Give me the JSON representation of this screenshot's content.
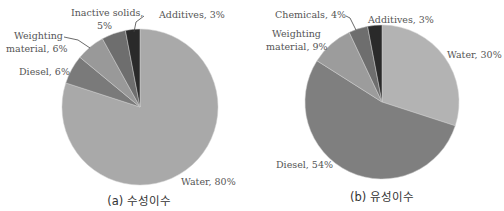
{
  "chart_data": [
    {
      "type": "pie",
      "title": "(a) 수성이수",
      "categories": [
        "Water",
        "Diesel",
        "Weighting material",
        "Inactive solids",
        "Additives"
      ],
      "values": [
        80,
        6,
        6,
        5,
        3
      ],
      "unit": "%",
      "colors": [
        "#a9a9a9",
        "#7a7a7a",
        "#999999",
        "#6e6e6e",
        "#2a2a2a"
      ],
      "labels": [
        "Water, 80%",
        "Diesel, 6%",
        "Weighting material, 6%",
        "Inactive solids, 5%",
        "Additives, 3%"
      ]
    },
    {
      "type": "pie",
      "title": "(b) 유성이수",
      "categories": [
        "Water",
        "Diesel",
        "Weighting material",
        "Chemicals",
        "Additives"
      ],
      "values": [
        30,
        54,
        9,
        4,
        3
      ],
      "unit": "%",
      "colors": [
        "#b3b3b3",
        "#7f7f7f",
        "#9c9c9c",
        "#6e6e6e",
        "#2a2a2a"
      ],
      "labels": [
        "Water, 30%",
        "Diesel, 54%",
        "Weighting material, 9%",
        "Chemicals, 4%",
        "Additives, 3%"
      ]
    }
  ],
  "captions": {
    "left": "(a) 수성이수",
    "right": "(b) 유성이수"
  },
  "left_labels": {
    "inactive_1": "Inactive solids,",
    "inactive_2": "5%",
    "additives": "Additives, 3%",
    "weighting_1": "Weighting",
    "weighting_2": "material, 6%",
    "diesel": "Diesel, 6%",
    "water": "Water, 80%"
  },
  "right_labels": {
    "chemicals": "Chemicals, 4%",
    "additives": "Additives, 3%",
    "weighting_1": "Weighting",
    "weighting_2": "material, 9%",
    "water": "Water, 30%",
    "diesel": "Diesel, 54%"
  }
}
